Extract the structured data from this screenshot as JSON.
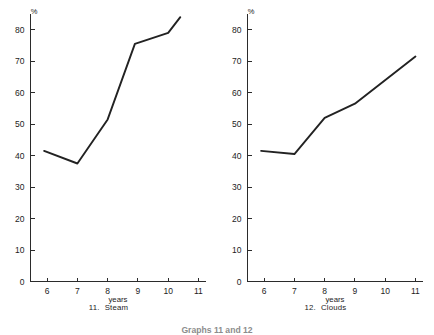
{
  "figure": {
    "caption": "Graphs 11 and 12"
  },
  "chart_data": [
    {
      "type": "line",
      "title": "11. Steam",
      "caption_number": "11.",
      "caption_name": "Steam",
      "xlabel": "years",
      "ylabel": "%",
      "ylim": [
        0,
        85
      ],
      "xlim": [
        5.45,
        11.25
      ],
      "yticks": [
        0,
        10,
        20,
        30,
        40,
        50,
        60,
        70,
        80
      ],
      "ytick_labels": [
        "0",
        "10",
        "20",
        "30",
        "40",
        "50",
        "60",
        "70",
        "80"
      ],
      "xticks": [
        6,
        7,
        8,
        9,
        10,
        11
      ],
      "xtick_labels": [
        "6",
        "7",
        "8",
        "9",
        "10",
        "11"
      ],
      "grid": false,
      "legend": "none",
      "series": [
        {
          "name": "Steam",
          "x": [
            5.9,
            7.0,
            8.0,
            8.9,
            10.0,
            10.4
          ],
          "values": [
            41.5,
            37.5,
            51.5,
            75.5,
            79.0,
            84.0
          ]
        }
      ]
    },
    {
      "type": "line",
      "title": "12. Clouds",
      "caption_number": "12.",
      "caption_name": "Clouds",
      "xlabel": "years",
      "ylabel": "%",
      "ylim": [
        0,
        85
      ],
      "xlim": [
        5.45,
        11.25
      ],
      "yticks": [
        0,
        10,
        20,
        30,
        40,
        50,
        60,
        70,
        80
      ],
      "ytick_labels": [
        "0",
        "10",
        "20",
        "30",
        "40",
        "50",
        "60",
        "70",
        "80"
      ],
      "xticks": [
        6,
        7,
        8,
        9,
        10,
        11
      ],
      "xtick_labels": [
        "6",
        "7",
        "8",
        "9",
        "10",
        "11"
      ],
      "grid": false,
      "legend": "none",
      "series": [
        {
          "name": "Clouds",
          "x": [
            5.9,
            7.0,
            8.0,
            9.0,
            11.0
          ],
          "values": [
            41.5,
            40.5,
            52.0,
            56.5,
            71.5
          ]
        }
      ]
    }
  ]
}
